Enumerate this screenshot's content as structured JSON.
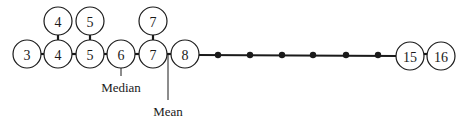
{
  "diagram": {
    "row_y": 54,
    "stack_y": 21,
    "radius": 14,
    "nodes_row": [
      {
        "value": "3",
        "x": 27
      },
      {
        "value": "4",
        "x": 58
      },
      {
        "value": "5",
        "x": 90
      },
      {
        "value": "6",
        "x": 121
      },
      {
        "value": "7",
        "x": 153
      },
      {
        "value": "8",
        "x": 185
      },
      {
        "value": "15",
        "x": 410
      },
      {
        "value": "16",
        "x": 441
      }
    ],
    "nodes_stacked": [
      {
        "value": "4",
        "x": 58
      },
      {
        "value": "5",
        "x": 90
      },
      {
        "value": "7",
        "x": 153
      }
    ],
    "gap_dots_x": [
      218,
      250,
      282,
      313,
      346,
      378
    ],
    "median": {
      "label": "Median",
      "x": 121
    },
    "mean": {
      "label": "Mean",
      "x": 168
    },
    "colors": {
      "ink": "#1a1a1a",
      "background": "#ffffff"
    }
  }
}
